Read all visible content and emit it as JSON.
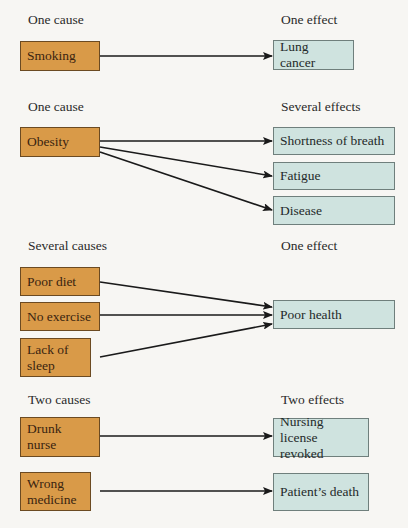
{
  "sections": [
    {
      "cause_heading": "One cause",
      "effect_heading": "One effect",
      "causes": [
        "Smoking"
      ],
      "effects": [
        "Lung cancer"
      ]
    },
    {
      "cause_heading": "One cause",
      "effect_heading": "Several effects",
      "causes": [
        "Obesity"
      ],
      "effects": [
        "Shortness of breath",
        "Fatigue",
        "Disease"
      ]
    },
    {
      "cause_heading": "Several causes",
      "effect_heading": "One effect",
      "causes": [
        "Poor diet",
        "No exercise",
        "Lack of sleep"
      ],
      "effects": [
        "Poor health"
      ]
    },
    {
      "cause_heading": "Two causes",
      "effect_heading": "Two effects",
      "causes": [
        "Drunk nurse",
        "Wrong medicine"
      ],
      "effects": [
        "Nursing license revoked",
        "Patient’s death"
      ]
    }
  ],
  "colors": {
    "cause_fill": "#d99a48",
    "effect_fill": "#cfe3df",
    "arrow": "#1a1a1a"
  }
}
